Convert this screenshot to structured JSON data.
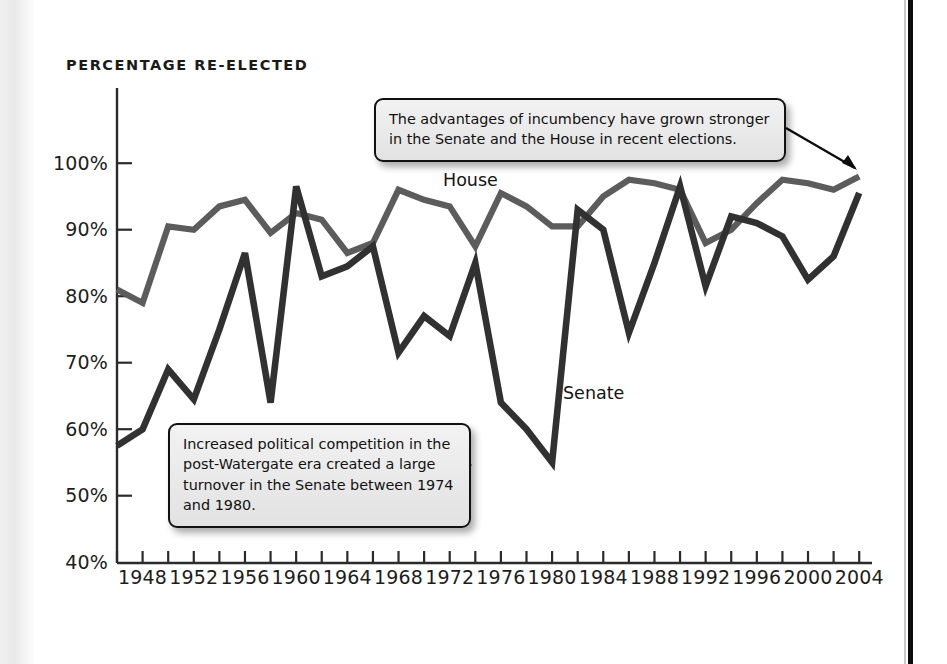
{
  "chart_title": "PERCENTAGE RE-ELECTED",
  "colors": {
    "house_line": "#5c5c5c",
    "senate_line": "#313131",
    "axis": "#2b2b2b",
    "callout_border": "#111111",
    "callout_fill": "#ececec",
    "page_rule": "#0d0d0d"
  },
  "series_labels": {
    "house": "House",
    "senate": "Senate"
  },
  "callouts": [
    {
      "id": "incumbency",
      "text": "The advantages of incumbency have grown stronger in the Senate and the House in recent elections."
    },
    {
      "id": "watergate",
      "text": "Increased political competition in the post-Watergate era created a large turnover in the Senate between 1974 and 1980."
    }
  ],
  "chart_data": {
    "type": "line",
    "title": "PERCENTAGE RE-ELECTED",
    "xlabel": "",
    "ylabel": "Percentage re-elected",
    "ylim": [
      40,
      100
    ],
    "xlim": [
      1946,
      2005
    ],
    "grid": false,
    "legend": "inline-labels",
    "y_ticks": [
      "40%",
      "50%",
      "60%",
      "70%",
      "80%",
      "90%",
      "100%"
    ],
    "y_tick_values": [
      40,
      50,
      60,
      70,
      80,
      90,
      100
    ],
    "x_ticks": [
      "1948",
      "1952",
      "1956",
      "1960",
      "1964",
      "1968",
      "1972",
      "1976",
      "1980",
      "1984",
      "1988",
      "1992",
      "1996",
      "2000",
      "2004"
    ],
    "x_tick_values": [
      1948,
      1952,
      1956,
      1960,
      1964,
      1968,
      1972,
      1976,
      1980,
      1984,
      1988,
      1992,
      1996,
      2000,
      2004
    ],
    "minor_x_tick_values": [
      1946,
      1950,
      1954,
      1958,
      1962,
      1966,
      1970,
      1974,
      1978,
      1982,
      1986,
      1990,
      1994,
      1998,
      2002
    ],
    "x": [
      1946,
      1948,
      1950,
      1952,
      1954,
      1956,
      1958,
      1960,
      1962,
      1964,
      1966,
      1968,
      1970,
      1972,
      1974,
      1976,
      1978,
      1980,
      1982,
      1984,
      1986,
      1988,
      1990,
      1992,
      1994,
      1996,
      1998,
      2000,
      2002,
      2004
    ],
    "series": [
      {
        "name": "House",
        "color": "#5c5c5c",
        "values": [
          81,
          79,
          90.5,
          90,
          93.5,
          94.5,
          89.5,
          92.5,
          91.5,
          86.5,
          88,
          96,
          94.5,
          93.5,
          87.5,
          95.5,
          93.5,
          90.5,
          90.5,
          95,
          97.5,
          97,
          96,
          88,
          90,
          94,
          97.5,
          97,
          96,
          98
        ]
      },
      {
        "name": "Senate",
        "color": "#313131",
        "values": [
          57.5,
          60,
          69,
          64.5,
          75,
          86.5,
          64,
          96.5,
          83,
          84.5,
          87.5,
          71.5,
          77,
          74,
          85,
          64,
          60,
          55,
          93,
          90,
          74.5,
          85,
          96.5,
          81.5,
          92,
          91,
          89,
          82.5,
          86,
          95.5
        ]
      }
    ],
    "annotations": [
      {
        "text": "The advantages of incumbency have grown stronger in the Senate and the House in recent elections.",
        "points_to": "2004 House endpoint (~98%)"
      },
      {
        "text": "Increased political competition in the post-Watergate era created a large turnover in the Senate between 1974 and 1980.",
        "points_to": "Senate 1976-1980 decline (~55-64%)"
      }
    ]
  }
}
